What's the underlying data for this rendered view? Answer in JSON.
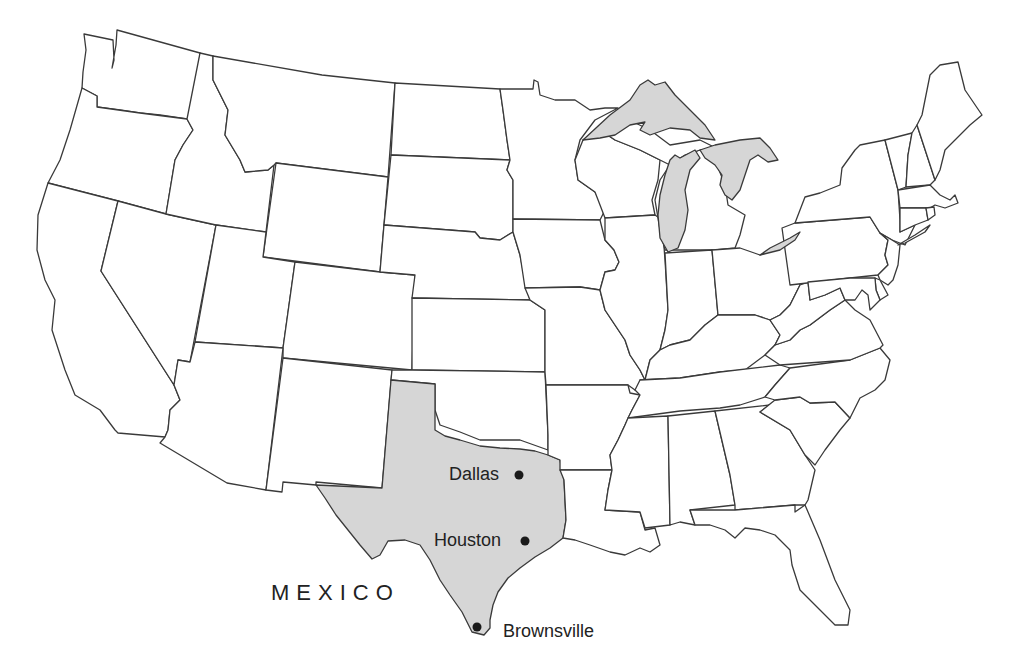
{
  "map": {
    "type": "outline map of the contiguous United States",
    "highlighted_region": {
      "name": "Texas",
      "fill": "#d6d6d6"
    },
    "water_fill": "#d6d6d6",
    "outline_color": "#3a3a3a",
    "background": "#ffffff"
  },
  "labels": {
    "country": "MEXICO",
    "cities": [
      {
        "name": "Dallas",
        "x": 519,
        "y": 475
      },
      {
        "name": "Houston",
        "x": 525,
        "y": 541
      },
      {
        "name": "Brownsville",
        "x": 477,
        "y": 627
      }
    ]
  }
}
